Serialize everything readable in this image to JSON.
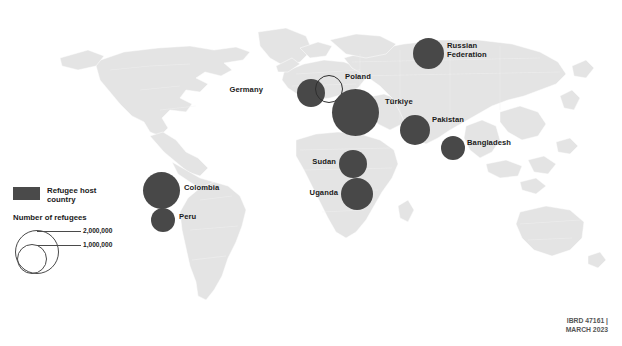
{
  "figure": {
    "colors": {
      "bubble_fill": "#484848",
      "land_fill": "#e4e4e4",
      "border_stroke": "#ffffff",
      "background": "#ffffff",
      "label_text": "#1a1a1a"
    }
  },
  "legend": {
    "swatch_label": "Refugee host\ncountry",
    "size_title": "Number of refugees",
    "size_keys": [
      {
        "label": "2,000,000",
        "value": 2000000
      },
      {
        "label": "1,000,000",
        "value": 1000000
      }
    ]
  },
  "credit": {
    "line1": "IBRD 47161 |",
    "line2": "MARCH 2023"
  },
  "chart_data": {
    "type": "bubble-map",
    "value_unit": "refugees",
    "legend_breaks": [
      2000000,
      1000000
    ],
    "points": [
      {
        "name": "Russian Federation",
        "label": "Russian\nFederation",
        "cx": 428.5,
        "cy": 53.5,
        "d": 31,
        "value": 1200000,
        "style": "filled",
        "label_x": 447,
        "label_y": 42,
        "label_anchor": "left"
      },
      {
        "name": "Germany",
        "label": "Germany",
        "cx": 311,
        "cy": 93,
        "d": 28,
        "value": 1000000,
        "style": "filled",
        "label_x": 263,
        "label_y": 86,
        "label_anchor": "right"
      },
      {
        "name": "Poland",
        "label": "Poland",
        "cx": 329,
        "cy": 89,
        "d": 28,
        "value": 1000000,
        "style": "outlined",
        "label_x": 345,
        "label_y": 73,
        "label_anchor": "left"
      },
      {
        "name": "Türkiye",
        "label": "Türkiye",
        "cx": 355.5,
        "cy": 112.5,
        "d": 47,
        "value": 3600000,
        "style": "filled",
        "label_x": 385,
        "label_y": 98,
        "label_anchor": "left"
      },
      {
        "name": "Pakistan",
        "label": "Pakistan",
        "cx": 415,
        "cy": 130,
        "d": 30,
        "value": 1500000,
        "style": "filled",
        "label_x": 432,
        "label_y": 116,
        "label_anchor": "left"
      },
      {
        "name": "Bangladesh",
        "label": "Bangladesh",
        "cx": 453,
        "cy": 148,
        "d": 24,
        "value": 900000,
        "style": "filled",
        "label_x": 467,
        "label_y": 139,
        "label_anchor": "left"
      },
      {
        "name": "Sudan",
        "label": "Sudan",
        "cx": 353,
        "cy": 164,
        "d": 28,
        "value": 1000000,
        "style": "filled",
        "label_x": 336,
        "label_y": 158,
        "label_anchor": "right"
      },
      {
        "name": "Uganda",
        "label": "Uganda",
        "cx": 357,
        "cy": 194,
        "d": 32,
        "value": 1500000,
        "style": "filled",
        "label_x": 338,
        "label_y": 189,
        "label_anchor": "right"
      },
      {
        "name": "Colombia",
        "label": "Colombia",
        "cx": 161.5,
        "cy": 190,
        "d": 37,
        "value": 2500000,
        "style": "filled",
        "label_x": 184,
        "label_y": 184,
        "label_anchor": "left"
      },
      {
        "name": "Peru",
        "label": "Peru",
        "cx": 163,
        "cy": 220,
        "d": 24,
        "value": 900000,
        "style": "filled",
        "label_x": 179,
        "label_y": 213,
        "label_anchor": "left"
      }
    ]
  }
}
